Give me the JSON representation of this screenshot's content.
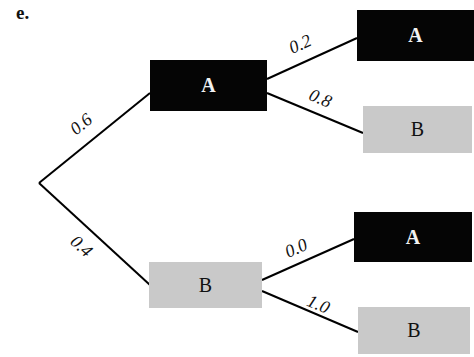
{
  "panel_label": "e.",
  "colors": {
    "outcome_a_fill": "#050505",
    "outcome_a_text": "#f2f2f2",
    "outcome_b_fill": "#c9c9c9",
    "outcome_b_text": "#111111",
    "edge": "#000000"
  },
  "tree": {
    "root": {
      "label": ""
    },
    "level1": [
      {
        "label": "A",
        "probability": "0.6",
        "children": [
          {
            "label": "A",
            "probability": "0.2"
          },
          {
            "label": "B",
            "probability": "0.8"
          }
        ]
      },
      {
        "label": "B",
        "probability": "0.4",
        "children": [
          {
            "label": "A",
            "probability": "0.0"
          },
          {
            "label": "B",
            "probability": "1.0"
          }
        ]
      }
    ]
  }
}
